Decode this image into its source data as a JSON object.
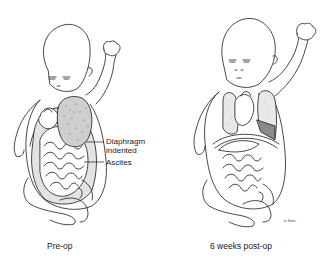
{
  "figure": {
    "panels": [
      {
        "id": "pre-op",
        "caption": "Pre-op",
        "labels": {
          "diaphragm_line1": "Diaphragm",
          "diaphragm_line2": "indented",
          "ascites": "Ascites"
        }
      },
      {
        "id": "post-op",
        "caption": "6 weeks post-op",
        "signature": "w. Snow"
      }
    ],
    "colors": {
      "line": "#1a1a1a",
      "shade": "#cfcfcf",
      "dark_shade": "#8a8a8a",
      "background": "#ffffff"
    }
  }
}
